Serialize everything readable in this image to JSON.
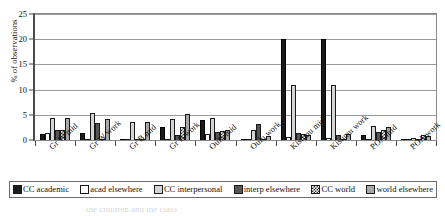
{
  "chart_data": {
    "type": "bar",
    "title": "",
    "subtitle": "",
    "xlabel": "",
    "ylabel": "% of observations",
    "ylim": [
      0,
      25
    ],
    "yticks": [
      0,
      5,
      10,
      15,
      20,
      25
    ],
    "grid": true,
    "legend_position": "bottom",
    "orientation": "vertical",
    "grouping": "clustered",
    "categories": [
      "Gr W mid",
      "Gr W work",
      "Gr B mid",
      "Gr B work",
      "Oulu mid",
      "Oulu work",
      "Kisumu mid",
      "Kisumu work",
      "POA mid",
      "POA work"
    ],
    "series": [
      {
        "name": "CC academic",
        "color": "#1b1b1b",
        "pattern": "solid-black",
        "values": [
          1.1,
          1.3,
          0.2,
          2.5,
          3.9,
          0.3,
          20.0,
          20.0,
          0.9,
          0.2
        ]
      },
      {
        "name": "acad elsewhere",
        "color": "#ffffff",
        "pattern": "solid-white",
        "values": [
          1.4,
          0.2,
          0.2,
          0.3,
          1.1,
          0.2,
          0.6,
          0.4,
          0.2,
          0.2
        ]
      },
      {
        "name": "CC interpersonal",
        "color": "#d4d4d4",
        "pattern": "light-gray",
        "values": [
          4.4,
          5.4,
          3.5,
          4.2,
          4.3,
          2.0,
          11.0,
          11.0,
          2.7,
          0.4
        ]
      },
      {
        "name": "interp elsewhere",
        "color": "#565656",
        "pattern": "dark-gray",
        "values": [
          2.0,
          3.4,
          0.2,
          0.9,
          1.5,
          3.1,
          1.4,
          0.9,
          1.5,
          0.3
        ]
      },
      {
        "name": "CC world",
        "color": "#efefef",
        "pattern": "checkered",
        "values": [
          2.0,
          0.2,
          0.2,
          2.5,
          1.7,
          0.2,
          1.2,
          0.2,
          1.9,
          0.9
        ]
      },
      {
        "name": "world elsewhere",
        "color": "#a8a8a8",
        "pattern": "medium-gray",
        "values": [
          4.4,
          4.1,
          3.5,
          5.1,
          2.0,
          0.8,
          1.0,
          1.1,
          2.5,
          0.8
        ]
      }
    ]
  },
  "caption": {
    "cutoff_text": "the children and the class"
  }
}
